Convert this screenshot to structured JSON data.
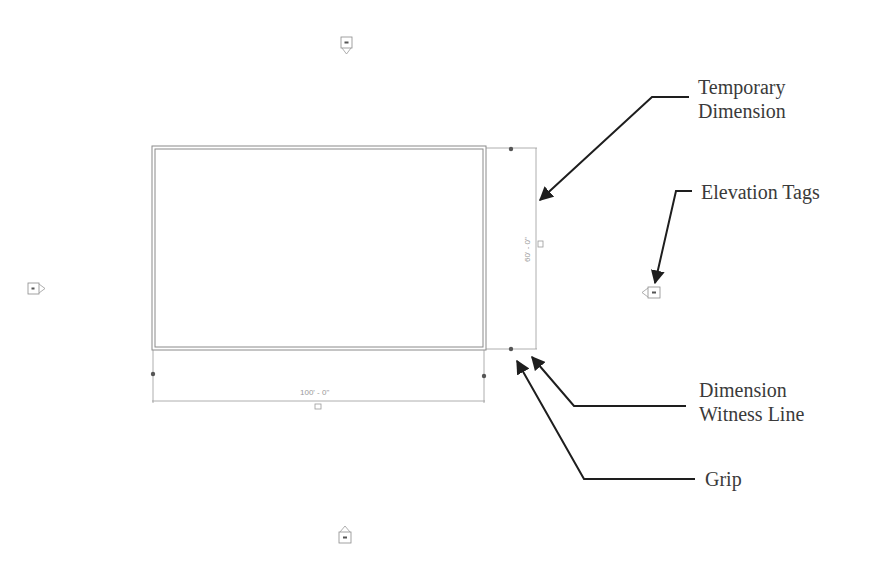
{
  "figure": {
    "background": "#ffffff"
  },
  "drawing": {
    "rectangle": {
      "outer": [
        152,
        146,
        486,
        350
      ],
      "inner": [
        155,
        149,
        483,
        347
      ],
      "stroke": "#8a8a8a"
    },
    "horizontal_dimension": {
      "value": "100' - 0\"",
      "line_y": 401,
      "x1": 153,
      "x2": 484
    },
    "vertical_dimension": {
      "value": "60' - 0\"",
      "line_x": 536,
      "y1": 148,
      "y2": 349
    },
    "grips": [
      {
        "x": 511,
        "y": 149
      },
      {
        "x": 511,
        "y": 349
      },
      {
        "x": 153,
        "y": 374
      },
      {
        "x": 484,
        "y": 376
      }
    ],
    "elevation_tags": [
      {
        "name": "north",
        "x": 346,
        "y": 44,
        "direction": "down"
      },
      {
        "name": "west",
        "x": 35,
        "y": 288,
        "direction": "right"
      },
      {
        "name": "east",
        "x": 653,
        "y": 292,
        "direction": "left"
      },
      {
        "name": "south",
        "x": 345,
        "y": 537,
        "direction": "up"
      }
    ]
  },
  "callouts": {
    "temporary_dimension": {
      "line1": "Temporary",
      "line2": "Dimension"
    },
    "elevation_tags": {
      "line1": "Elevation Tags"
    },
    "dimension_witness_line": {
      "line1": "Dimension",
      "line2": "Witness Line"
    },
    "grip": {
      "line1": "Grip"
    }
  },
  "colors": {
    "arrow": "#1e1e1e",
    "label_text": "#3a3a3a",
    "dim_text": "#9a9a9a",
    "drawing_line": "#8a8a8a"
  }
}
